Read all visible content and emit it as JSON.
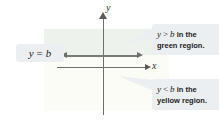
{
  "figure": {
    "axes": {
      "y_label": "y",
      "x_label": "x"
    },
    "boundary": {
      "name": "boundary-line-y-equals-b"
    },
    "regions": {
      "green": {
        "name": "green-region",
        "color": "#eef2ec"
      },
      "yellow": {
        "name": "yellow-region",
        "color": "#fcfcf7"
      }
    },
    "callouts": {
      "equals": {
        "variable": "y",
        "relation": "=",
        "constant": "b"
      },
      "greater": {
        "variable": "y",
        "relation": ">",
        "constant": "b",
        "suffix": " in the",
        "line2": "green region."
      },
      "less": {
        "variable": "y",
        "relation": "<",
        "constant": "b",
        "suffix": " in the",
        "line2": "yellow region."
      }
    }
  }
}
